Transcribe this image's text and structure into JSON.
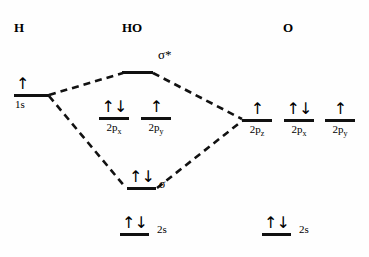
{
  "diagram": {
    "line_color": "#111111",
    "background": "#fefefe"
  },
  "columns": [
    {
      "name": "left",
      "label": "H"
    },
    {
      "name": "middle",
      "label": "HO"
    },
    {
      "name": "right",
      "label": "O"
    }
  ],
  "levels": {
    "h_1s": {
      "label": "1s",
      "electrons": "↑"
    },
    "sigma_star": {
      "label": "σ*",
      "electrons": ""
    },
    "ho_2px": {
      "label": "2p",
      "sub": "x",
      "electrons": "↑↓"
    },
    "ho_2py": {
      "label": "2p",
      "sub": "y",
      "electrons": "↑"
    },
    "o_2pz": {
      "label": "2p",
      "sub": "z",
      "electrons": "↑"
    },
    "o_2px": {
      "label": "2p",
      "sub": "x",
      "electrons": "↑↓"
    },
    "o_2py": {
      "label": "2p",
      "sub": "y",
      "electrons": "↑"
    },
    "sigma": {
      "label": "σ",
      "electrons": "↑↓"
    },
    "ho_2s": {
      "label": "2s",
      "electrons": "↑↓"
    },
    "o_2s": {
      "label": "2s",
      "electrons": "↑↓"
    }
  }
}
